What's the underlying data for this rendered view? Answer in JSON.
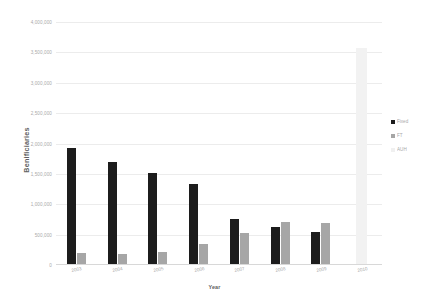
{
  "chart_data": {
    "type": "bar",
    "title": "",
    "xlabel": "Year",
    "ylabel": "Benificiaries",
    "categories": [
      "2003",
      "2004",
      "2005",
      "2006",
      "2007",
      "2008",
      "2009",
      "2010"
    ],
    "series": [
      {
        "name": "Fixed",
        "color": "#1c1c1c",
        "values": [
          1920000,
          1700000,
          1510000,
          1340000,
          760000,
          620000,
          540000,
          0
        ]
      },
      {
        "name": "FT",
        "color": "#a6a6a6",
        "values": [
          190000,
          180000,
          215000,
          350000,
          535000,
          700000,
          695000,
          0
        ]
      },
      {
        "name": "AUH",
        "color": "#f2f2f2",
        "values": [
          0,
          0,
          0,
          0,
          0,
          0,
          0,
          3570000
        ]
      }
    ],
    "ylim": [
      0,
      4000000
    ],
    "ytick_values": [
      0,
      500000,
      1000000,
      1500000,
      2000000,
      2500000,
      3000000,
      3500000,
      4000000
    ],
    "ytick_labels": [
      "0",
      "500,000",
      "1,000,000",
      "1,500,000",
      "2,000,000",
      "2,500,000",
      "3,000,000",
      "3,500,000",
      "4,000,000"
    ],
    "grid": true,
    "legend_position": "right"
  },
  "legend": {
    "items": [
      {
        "label": "Fixed"
      },
      {
        "label": "FT"
      },
      {
        "label": "AUH"
      }
    ]
  }
}
